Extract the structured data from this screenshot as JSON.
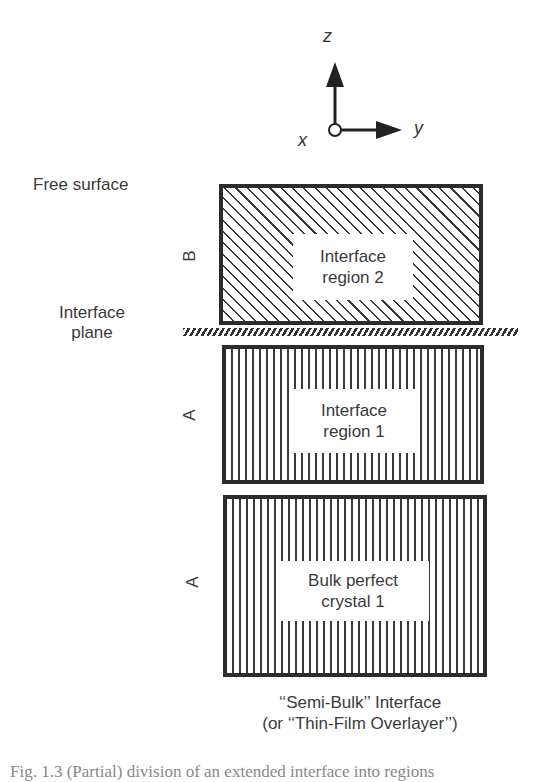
{
  "axes": {
    "z_label": "z",
    "y_label": "y",
    "x_label": "x"
  },
  "left_labels": {
    "free_surface": "Free surface",
    "interface_plane_line1": "Interface",
    "interface_plane_line2": "plane"
  },
  "regions": [
    {
      "side_label": "B",
      "line1": "Interface",
      "line2": "region 2",
      "pattern": "diagonal-hatch"
    },
    {
      "side_label": "A",
      "line1": "Interface",
      "line2": "region 1",
      "pattern": "vertical-hatch"
    },
    {
      "side_label": "A",
      "line1": "Bulk perfect",
      "line2": "crystal 1",
      "pattern": "vertical-hatch"
    }
  ],
  "caption": {
    "line1": "‘‘Semi-Bulk’’ Interface",
    "line2": "(or ‘‘Thin-Film Overlayer’’)"
  },
  "figure_caption_partial": "Fig. 1.3 (Partial) division of an extended interface into regions"
}
